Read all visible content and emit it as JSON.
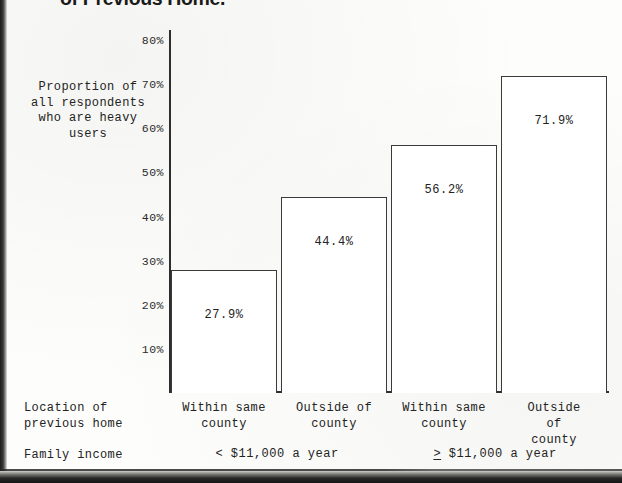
{
  "document": {
    "title_visible_fragment": "of Previous Home."
  },
  "chart_data": {
    "type": "bar",
    "title": "of Previous Home.",
    "categories": [
      "Within same county",
      "Outside of county",
      "Within same county",
      "Outside of county"
    ],
    "values": [
      27.9,
      44.4,
      56.2,
      71.9
    ],
    "value_labels": [
      "27.9%",
      "44.4%",
      "56.2%",
      "71.9%"
    ],
    "ylabel": "Proportion of all respondents who are heavy users",
    "ylabel_lines": [
      "Proportion",
      "of all",
      "respondents",
      "who are",
      "heavy users"
    ],
    "xlabel": "Location of previous home",
    "ylim": [
      0,
      80
    ],
    "yticks": [
      80,
      70,
      60,
      50,
      40,
      30,
      20,
      10
    ],
    "ytick_labels": [
      "80%",
      "70%",
      "60%",
      "50%",
      "40%",
      "30%",
      "20%",
      "10%"
    ],
    "grid": false,
    "legend": "none",
    "groups": [
      {
        "label_prefix": "<",
        "label": "< $11,000 a year",
        "categories": [
          0,
          1
        ]
      },
      {
        "label_prefix": "≥",
        "label": "$11,000 a year",
        "categories": [
          2,
          3
        ]
      }
    ]
  },
  "axis": {
    "y_label_block": "Proportion\nof all\nrespondents\nwho are\nheavy users",
    "ticks": [
      {
        "label": "80%",
        "value": 80
      },
      {
        "label": "70%",
        "value": 70
      },
      {
        "label": "60%",
        "value": 60
      },
      {
        "label": "50%",
        "value": 50
      },
      {
        "label": "40%",
        "value": 40
      },
      {
        "label": "30%",
        "value": 30
      },
      {
        "label": "20%",
        "value": 20
      },
      {
        "label": "10%",
        "value": 10
      }
    ]
  },
  "bars": [
    {
      "value": 27.9,
      "label": "27.9%",
      "category": "Within same\ncounty"
    },
    {
      "value": 44.4,
      "label": "44.4%",
      "category": "Outside of\ncounty"
    },
    {
      "value": 56.2,
      "label": "56.2%",
      "category": "Within same\ncounty"
    },
    {
      "value": 71.9,
      "label": "71.9%",
      "category": "Outside of\ncounty"
    }
  ],
  "footer": {
    "location_row_label": "Location of\nprevious home",
    "income_row_label": "Family income",
    "income_low_sign": "<",
    "income_low_text": " $11,000 a year",
    "income_high_sign": ">",
    "income_high_text": " $11,000 a year"
  },
  "colors": {
    "ink": "#262626",
    "paper": "#fdfdfb",
    "bar_outline": "#3a3a3a",
    "bar_fill": "#ffffff"
  }
}
